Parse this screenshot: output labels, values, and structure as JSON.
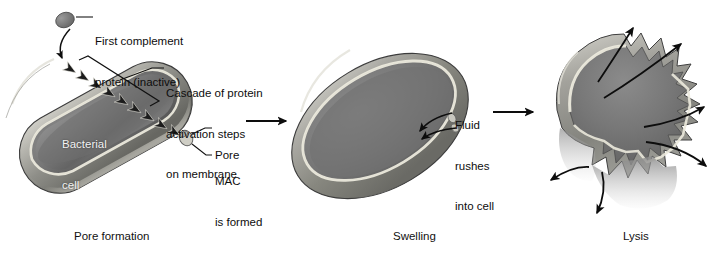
{
  "figure": {
    "title_visible": false,
    "background_color": "#ffffff",
    "ink_color": "#0d0d0d"
  },
  "panels": [
    {
      "id": "panel-pore-formation",
      "caption": "Pore formation",
      "caption_x": 74,
      "caption_y": 236,
      "cell": {
        "shape": "rod",
        "name": "bacterial-cell-intact",
        "inline_label": "Bacterial\ncell",
        "inline_label_line1": "Bacterial",
        "inline_label_line2": "cell",
        "colors": {
          "interior": "#7b7b7b",
          "interior_dark": "#5d5d5d",
          "wall": "#9a9a9a",
          "wall_light": "#c9c9c3",
          "membrane_line": "#e8e6da",
          "outline": "#3a3a3a"
        }
      },
      "labels": [
        {
          "name": "first-complement-protein",
          "lines": [
            "First complement",
            "protein (inactive)"
          ],
          "x": 95,
          "y": 9
        },
        {
          "name": "cascade-of-protein-activation",
          "lines": [
            "Cascade of protein",
            "activation steps",
            "on membrane"
          ],
          "x": 166,
          "y": 61
        },
        {
          "name": "pore",
          "lines": [
            "Pore"
          ],
          "x": 215,
          "y": 129
        },
        {
          "name": "mac-is-formed",
          "lines": [
            "MAC",
            "is formed"
          ],
          "x": 215,
          "y": 152
        }
      ],
      "elements": {
        "complement_protein_blob": "gray-ellipse",
        "cascade_arrowheads_count": 9,
        "pore_marker": "pore-cylinder"
      }
    },
    {
      "id": "panel-swelling",
      "caption": "Swelling",
      "caption_x": 393,
      "caption_y": 236,
      "cell": {
        "shape": "swollen-ellipse",
        "name": "bacterial-cell-swollen",
        "colors": {
          "interior": "#7b7b7b",
          "interior_dark": "#606060",
          "wall": "#9c9c9c",
          "membrane_line": "#e8e6da",
          "outline": "#3a3a3a"
        }
      },
      "labels": [
        {
          "name": "fluid-rushes-into-cell",
          "lines": [
            "Fluid",
            "rushes",
            "into cell"
          ],
          "x": 455,
          "y": 99
        }
      ],
      "elements": {
        "inflow_arrows_count": 2
      }
    },
    {
      "id": "panel-lysis",
      "caption": "Lysis",
      "caption_x": 623,
      "caption_y": 236,
      "cell": {
        "shape": "ruptured-jagged",
        "name": "bacterial-cell-lysed",
        "colors": {
          "interior": "#7d7d7d",
          "interior_dark": "#636363",
          "wall": "#9c9c9c",
          "membrane_line": "#e8e6da",
          "outline": "#3a3a3a"
        }
      },
      "labels": [],
      "elements": {
        "burst_arrows_count": 6
      }
    }
  ],
  "transition_arrows": [
    {
      "name": "arrow-pore-to-swelling",
      "x1": 246,
      "y1": 121,
      "x2": 288,
      "y2": 121
    },
    {
      "name": "arrow-swelling-to-lysis",
      "x1": 493,
      "y1": 112,
      "x2": 535,
      "y2": 112
    }
  ]
}
